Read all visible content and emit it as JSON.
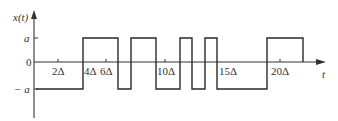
{
  "diagram": {
    "y_axis_label": "x(t)",
    "x_axis_label": "t",
    "y_levels": {
      "a": "a",
      "zero": "0",
      "neg_a": "− a"
    },
    "x_ticks": [
      {
        "label": "2Δ",
        "value": 2
      },
      {
        "label": "4Δ",
        "value": 4
      },
      {
        "label": "6Δ",
        "value": 6
      },
      {
        "label": "10Δ",
        "value": 10
      },
      {
        "label": "15Δ",
        "value": 15
      },
      {
        "label": "20Δ",
        "value": 20
      }
    ],
    "waveform": {
      "description": "Random binary (telegraph) signal switching between +a and -a",
      "segments": [
        {
          "from": 0,
          "to": 4,
          "level": "-a"
        },
        {
          "from": 4,
          "to": 7,
          "level": "+a"
        },
        {
          "from": 7,
          "to": 8,
          "level": "-a"
        },
        {
          "from": 8,
          "to": 10,
          "level": "+a"
        },
        {
          "from": 10,
          "to": 12,
          "level": "-a"
        },
        {
          "from": 12,
          "to": 13,
          "level": "+a"
        },
        {
          "from": 13,
          "to": 14,
          "level": "-a"
        },
        {
          "from": 14,
          "to": 15,
          "level": "+a"
        },
        {
          "from": 15,
          "to": 19,
          "level": "-a"
        },
        {
          "from": 19,
          "to": 22,
          "level": "+a"
        }
      ]
    }
  }
}
